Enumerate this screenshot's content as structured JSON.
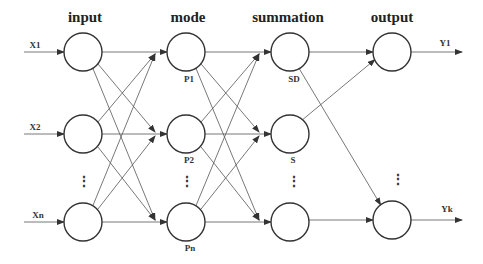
{
  "layers": [
    {
      "id": "input",
      "title": "input",
      "x": 83
    },
    {
      "id": "mode",
      "title": "mode",
      "x": 186
    },
    {
      "id": "summation",
      "title": "summation",
      "x": 290
    },
    {
      "id": "output",
      "title": "output",
      "x": 392
    }
  ],
  "rows_y": [
    52,
    134,
    222
  ],
  "dots_label": "⋮",
  "inputs": [
    {
      "label": "X1",
      "row": 0
    },
    {
      "label": "X2",
      "row": 1
    },
    {
      "label": "Xn",
      "row": 2
    }
  ],
  "mode_nodes": [
    {
      "label": "P1",
      "row": 0
    },
    {
      "label": "P2",
      "row": 1
    },
    {
      "label": "Pn",
      "row": 2
    }
  ],
  "summation_nodes": [
    {
      "label": "SD",
      "row": 0
    },
    {
      "label": "S",
      "row": 1
    },
    {
      "label": "",
      "row": 2
    }
  ],
  "outputs": [
    {
      "label": "Y1",
      "row": 0
    },
    {
      "label": "Yk",
      "row": 2
    }
  ]
}
